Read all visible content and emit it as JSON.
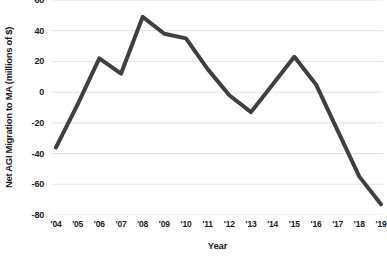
{
  "chart_data": {
    "type": "line",
    "title": "",
    "xlabel": "Year",
    "ylabel": "Net AGI Migration to MA (millions of $)",
    "categories": [
      "'04",
      "'05",
      "'06",
      "'07",
      "'08",
      "'09",
      "'10",
      "'11",
      "'12",
      "'13",
      "'14",
      "'15",
      "'16",
      "'17",
      "'18",
      "'19"
    ],
    "values": [
      -36,
      -8,
      22,
      12,
      49,
      38,
      35,
      15,
      -2,
      -13,
      5,
      23,
      5,
      -25,
      -55,
      -73
    ],
    "series": [
      {
        "name": "Net AGI Migration to MA",
        "values": [
          -36,
          -8,
          22,
          12,
          49,
          38,
          35,
          15,
          -2,
          -13,
          5,
          23,
          5,
          -25,
          -55,
          -73
        ]
      }
    ],
    "ylim": [
      -80,
      60
    ],
    "yticks": [
      60,
      40,
      20,
      0,
      -20,
      -40,
      -60,
      -80
    ],
    "ytick_labels": [
      "60",
      "40",
      "20",
      "0",
      "-20",
      "-40",
      "-60",
      "-80"
    ],
    "grid": true,
    "grid_axis": "y",
    "legend": false,
    "legend_position": "none",
    "colors": {
      "line": "#3f3f3f",
      "grid": "#e3e3e3",
      "text": "#1a1a1a",
      "background": "#ffffff"
    },
    "line_width": 4
  }
}
